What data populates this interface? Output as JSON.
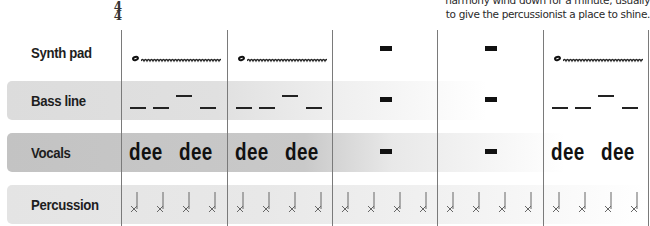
{
  "caption": {
    "line1": "harmony wind down for a minute, usually",
    "line2": "to give the percussionist a place to shine."
  },
  "time_signature": {
    "top": "4",
    "bottom": "4"
  },
  "tracks": [
    {
      "id": "synth",
      "label": "Synth pad",
      "band": false
    },
    {
      "id": "bass",
      "label": "Bass line",
      "band": true,
      "band_color": "#dcdcdc"
    },
    {
      "id": "vocals",
      "label": "Vocals",
      "band": true,
      "band_color": "#c3c3c3"
    },
    {
      "id": "percussion",
      "label": "Percussion",
      "band": true,
      "band_color": "#e4e4e4"
    }
  ],
  "measures": [
    {
      "number": 1,
      "synth": "whole-note-trill",
      "bass": "dashes",
      "vocals": [
        "dee",
        "dee"
      ],
      "percussion": "4 x-notes"
    },
    {
      "number": 2,
      "synth": "whole-note-trill",
      "bass": "dashes",
      "vocals": [
        "dee",
        "dee"
      ],
      "percussion": "4 x-notes"
    },
    {
      "number": 3,
      "synth": "rest",
      "bass": "rest",
      "vocals": "rest",
      "percussion": "4 x-notes"
    },
    {
      "number": 4,
      "synth": "rest",
      "bass": "rest",
      "vocals": "rest",
      "percussion": "4 x-notes"
    },
    {
      "number": 5,
      "synth": "whole-note-trill",
      "bass": "dashes",
      "vocals": [
        "dee",
        "dee"
      ],
      "percussion": "4 x-notes"
    }
  ],
  "lyric": "dee"
}
